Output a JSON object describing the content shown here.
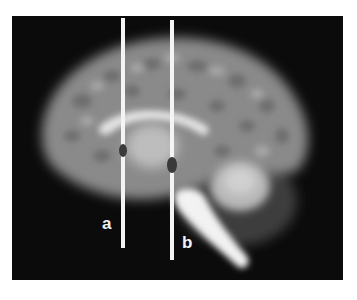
{
  "figure": {
    "background": "#0b0b0b",
    "lines": [
      {
        "id": "a",
        "label": "a",
        "x": 123,
        "y_top": 18,
        "y_bottom": 248,
        "marker": {
          "cx": 123,
          "cy": 150,
          "w": 8,
          "h": 13
        }
      },
      {
        "id": "b",
        "label": "b",
        "x": 172,
        "y_top": 20,
        "y_bottom": 260,
        "marker": {
          "cx": 172,
          "cy": 165,
          "w": 10,
          "h": 16
        }
      }
    ],
    "line_color": "#f4f4f4",
    "marker_color": "#3a3a3a"
  }
}
